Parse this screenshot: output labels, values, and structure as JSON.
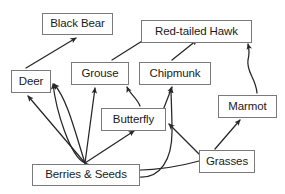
{
  "diagram": {
    "type": "food-web",
    "width": 285,
    "height": 194,
    "background_color": "#ffffff",
    "box_border_color": "#7a7a7a",
    "text_color": "#1a1a1a",
    "arrow_color": "#262626",
    "nodes": [
      {
        "id": "black-bear",
        "label": "Black Bear",
        "x": 42,
        "y": 13,
        "w": 71,
        "h": 22,
        "trophic": "consumer"
      },
      {
        "id": "red-tailed-hawk",
        "label": "Red-tailed Hawk",
        "x": 141,
        "y": 20,
        "w": 111,
        "h": 23,
        "trophic": "consumer"
      },
      {
        "id": "deer",
        "label": "Deer",
        "x": 11,
        "y": 70,
        "w": 40,
        "h": 23,
        "trophic": "consumer"
      },
      {
        "id": "grouse",
        "label": "Grouse",
        "x": 71,
        "y": 62,
        "w": 58,
        "h": 23,
        "trophic": "consumer"
      },
      {
        "id": "chipmunk",
        "label": "Chipmunk",
        "x": 139,
        "y": 62,
        "w": 72,
        "h": 23,
        "trophic": "consumer"
      },
      {
        "id": "butterfly",
        "label": "Butterfly",
        "x": 101,
        "y": 108,
        "w": 65,
        "h": 23,
        "trophic": "consumer"
      },
      {
        "id": "marmot",
        "label": "Marmot",
        "x": 218,
        "y": 95,
        "w": 59,
        "h": 23,
        "trophic": "consumer"
      },
      {
        "id": "berries-seeds",
        "label": "Berries & Seeds",
        "x": 32,
        "y": 164,
        "w": 108,
        "h": 22,
        "trophic": "producer"
      },
      {
        "id": "grasses",
        "label": "Grasses",
        "x": 199,
        "y": 150,
        "w": 56,
        "h": 23,
        "trophic": "producer"
      }
    ],
    "edges": [
      {
        "id": "deer-to-black-bear",
        "from": "deer",
        "to": "red-tailed-hawk-skip",
        "source_label": "Deer",
        "target_label": "Black Bear",
        "shape": "straight",
        "path": "M 26 68 L 76 38"
      },
      {
        "id": "grouse-to-hawk",
        "from": "grouse",
        "to": "red-tailed-hawk",
        "source_label": "Grouse",
        "target_label": "Red-tailed Hawk",
        "shape": "straight",
        "path": "M 112 60 L 166 26"
      },
      {
        "id": "chipmunk-to-hawk",
        "from": "chipmunk",
        "to": "red-tailed-hawk",
        "source_label": "Chipmunk",
        "target_label": "Red-tailed Hawk",
        "shape": "straight",
        "path": "M 172 60 L 197 40"
      },
      {
        "id": "marmot-to-hawk",
        "from": "marmot",
        "to": "red-tailed-hawk",
        "source_label": "Marmot",
        "target_label": "Red-tailed Hawk",
        "shape": "curved",
        "path": "M 257 93 C 256 78 246 72 248 60 C 250 52 249 48 248 44"
      },
      {
        "id": "butterfly-to-grouse",
        "from": "butterfly",
        "to": "grouse",
        "source_label": "Butterfly",
        "target_label": "Grouse",
        "shape": "curved",
        "path": "M 140 106 C 137 98 130 94 127 87"
      },
      {
        "id": "butterfly-to-chipmunk",
        "from": "butterfly",
        "to": "chipmunk",
        "source_label": "Butterfly",
        "target_label": "Chipmunk",
        "shape": "straight",
        "path": "M 160 118 L 172 87"
      },
      {
        "id": "berries-to-deer-left",
        "from": "berries-seeds",
        "to": "deer",
        "source_label": "Berries & Seeds",
        "target_label": "Deer",
        "shape": "straight",
        "path": "M 85 163 L 28 96"
      },
      {
        "id": "berries-to-deer-right",
        "from": "berries-seeds",
        "to": "deer",
        "source_label": "Berries & Seeds",
        "target_label": "Deer",
        "shape": "curved",
        "path": "M 85 163 C 76 136 68 100 54 84"
      },
      {
        "id": "berries-to-grouse",
        "from": "berries-seeds",
        "to": "grouse",
        "source_label": "Berries & Seeds",
        "target_label": "Grouse",
        "shape": "straight",
        "path": "M 85 163 L 95 88"
      },
      {
        "id": "berries-to-butterfly",
        "from": "berries-seeds",
        "to": "butterfly",
        "source_label": "Berries & Seeds",
        "target_label": "Butterfly",
        "shape": "straight",
        "path": "M 85 163 L 134 131"
      },
      {
        "id": "berries-to-chipmunk",
        "from": "berries-seeds",
        "to": "chipmunk",
        "source_label": "Berries & Seeds",
        "target_label": "Chipmunk",
        "shape": "curved",
        "path": "M 140 177 C 160 178 172 160 172 132 C 172 112 171 98 171 88"
      },
      {
        "id": "grasses-to-marmot",
        "from": "grasses",
        "to": "marmot",
        "source_label": "Grasses",
        "target_label": "Marmot",
        "shape": "straight",
        "path": "M 215 149 L 240 120"
      },
      {
        "id": "grasses-to-butterfly",
        "from": "grasses",
        "to": "butterfly",
        "source_label": "Grasses",
        "target_label": "Butterfly",
        "shape": "straight",
        "path": "M 200 155 L 169 124"
      },
      {
        "id": "grasses-to-deer",
        "from": "grasses",
        "to": "deer",
        "source_label": "Grasses",
        "target_label": "Deer",
        "shape": "curved",
        "path": "M 199 161 C 160 172 110 174 85 163 C 70 157 56 110 53 84"
      }
    ]
  }
}
